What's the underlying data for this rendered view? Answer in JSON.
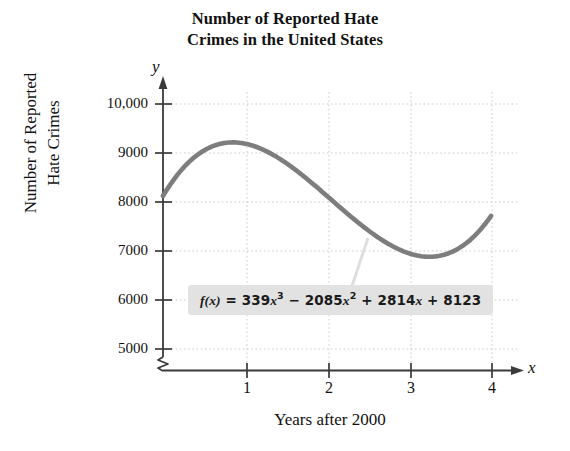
{
  "chart_data": {
    "type": "line",
    "title": "Number of Reported Hate Crimes in the United States",
    "title_lines": [
      "Number of Reported Hate",
      "Crimes in the United States"
    ],
    "xlabel": "Years after 2000",
    "ylabel": "Number of Reported Hate Crimes",
    "ylabel_lines": [
      "Number of Reported",
      "Hate Crimes"
    ],
    "x_axis_letter": "x",
    "y_axis_letter": "y",
    "xlim": [
      0,
      4.2
    ],
    "ylim": [
      4800,
      10400
    ],
    "y_axis_break": true,
    "grid": true,
    "grid_style": "dotted",
    "legend": "none",
    "annotation": {
      "text": "f(x) = 339x^3 - 2085x^2 + 2814x + 8123",
      "parts": {
        "fx": "f",
        "arg": "(x)",
        "eq": "=",
        "c3": "339",
        "v3": "x",
        "p3": "3",
        "op1": "−",
        "c2": "2085",
        "v2": "x",
        "p2": "2",
        "op2": "+",
        "c1": "2814",
        "v1": "x",
        "op3": "+",
        "c0": "8123"
      },
      "has_leader_line": true
    },
    "equation": {
      "form": "cubic",
      "a": 339,
      "b": -2085,
      "c": 2814,
      "d": 8123
    },
    "xticks": [
      1,
      2,
      3,
      4
    ],
    "xtick_labels": [
      "1",
      "2",
      "3",
      "4"
    ],
    "yticks": [
      5000,
      6000,
      7000,
      8000,
      9000,
      10000
    ],
    "ytick_labels": [
      "5000",
      "6000",
      "7000",
      "8000",
      "9000",
      "10,000"
    ],
    "x": [
      0,
      0.2,
      0.4,
      0.6,
      0.8,
      1.0,
      1.2,
      1.4,
      1.6,
      1.8,
      2.0,
      2.2,
      2.4,
      2.6,
      2.8,
      3.0,
      3.2,
      3.4,
      3.6,
      3.8,
      4.0
    ],
    "values": [
      8123,
      8604,
      8937,
      9142,
      9239,
      9191,
      9096,
      8917,
      8676,
      8392,
      8087,
      7780,
      7493,
      7245,
      7058,
      6950,
      6944,
      7059,
      7316,
      7736,
      8339
    ],
    "series": [
      {
        "name": "Reported hate crimes",
        "color": "#7d7d7d",
        "values": [
          8123,
          8604,
          8937,
          9142,
          9239,
          9191,
          9096,
          8917,
          8676,
          8392,
          8087,
          7780,
          7493,
          7245,
          7058,
          6950,
          6944,
          7059,
          7316,
          7736,
          8339
        ]
      }
    ],
    "features": {
      "start_value": 8123,
      "local_max_approx": 9200,
      "local_max_x_approx": 0.85,
      "local_min_approx": 6900,
      "local_min_x_approx": 3.2,
      "end_value_approx": 7650
    }
  },
  "colors": {
    "curve": "#7d7d7d",
    "axis": "#3a3a3a",
    "grid": "#c9c9c9",
    "annotation_background": "#e2e2e2",
    "text": "#111111",
    "background": "#ffffff"
  }
}
